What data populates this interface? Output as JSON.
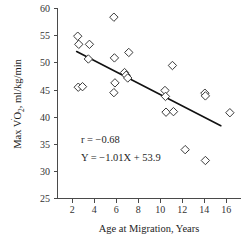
{
  "chart_data": {
    "type": "scatter",
    "title": "",
    "xlabel": "Age at Migration, Years",
    "ylabel": "Max V̇O₂, ml/kg/min",
    "ylabel_parts": {
      "prefix": "Max V",
      "dot": "̇",
      "o": "O",
      "subscript": "2",
      "suffix": ", ml/kg/min"
    },
    "xlim": [
      0,
      17.2
    ],
    "ylim": [
      25,
      60
    ],
    "xticks": [
      2,
      4,
      6,
      8,
      10,
      12,
      14,
      16
    ],
    "yticks": [
      25,
      30,
      35,
      40,
      45,
      50,
      55,
      60
    ],
    "xtick_labels": [
      "2",
      "4",
      "6",
      "8",
      "10",
      "12",
      "14",
      "16"
    ],
    "ytick_labels": [
      "25",
      "30",
      "35",
      "40",
      "45",
      "50",
      "55",
      "60"
    ],
    "grid": false,
    "legend": false,
    "marker": "diamond-open",
    "marker_color": "#3a3a3a",
    "points": [
      {
        "x": 1.9,
        "y": 54.9
      },
      {
        "x": 2.0,
        "y": 53.4
      },
      {
        "x": 3.0,
        "y": 53.4
      },
      {
        "x": 2.9,
        "y": 50.7
      },
      {
        "x": 1.95,
        "y": 45.5
      },
      {
        "x": 2.35,
        "y": 45.6
      },
      {
        "x": 5.3,
        "y": 58.4
      },
      {
        "x": 5.35,
        "y": 50.9
      },
      {
        "x": 6.7,
        "y": 51.9
      },
      {
        "x": 5.4,
        "y": 46.3
      },
      {
        "x": 5.3,
        "y": 44.5
      },
      {
        "x": 6.3,
        "y": 48.2
      },
      {
        "x": 6.45,
        "y": 47.7
      },
      {
        "x": 6.6,
        "y": 47.2
      },
      {
        "x": 10.8,
        "y": 49.5
      },
      {
        "x": 10.1,
        "y": 44.9
      },
      {
        "x": 10.15,
        "y": 43.8
      },
      {
        "x": 10.2,
        "y": 40.9
      },
      {
        "x": 10.9,
        "y": 41.0
      },
      {
        "x": 13.85,
        "y": 44.4
      },
      {
        "x": 13.9,
        "y": 43.9
      },
      {
        "x": 12.0,
        "y": 34.0
      },
      {
        "x": 13.9,
        "y": 32.0
      },
      {
        "x": 16.2,
        "y": 40.8
      }
    ],
    "fit_line": {
      "slope": -1.01,
      "intercept": 53.9,
      "x_start": 1.8,
      "x_end": 15.35
    },
    "annotations": [
      {
        "id": "correlation",
        "text": "r = −0.68",
        "x": 2.2,
        "y": 35.2
      },
      {
        "id": "regression-equation",
        "text": "Y = −1.01X + 53.9",
        "x": 2.2,
        "y": 32.0
      }
    ]
  }
}
